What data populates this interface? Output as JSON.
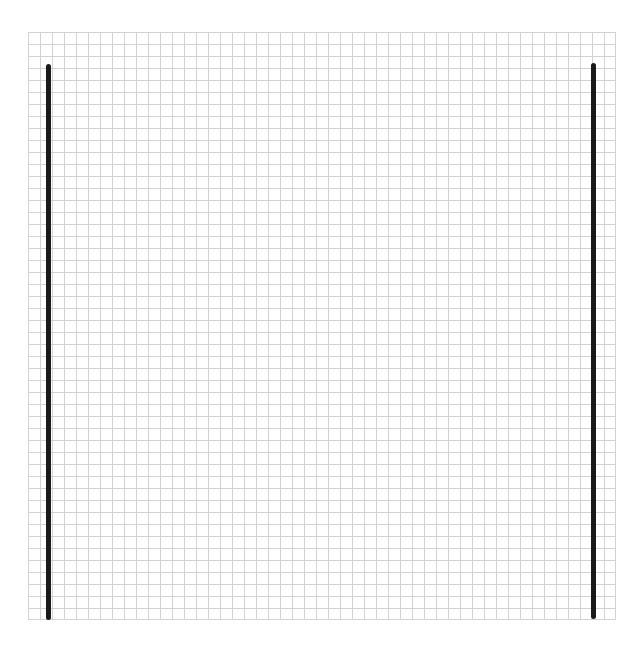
{
  "canvas": {
    "width": 643,
    "height": 653,
    "background": "#ffffff"
  },
  "grid": {
    "cell_size": 12,
    "line_color": "#d2d2d2",
    "left": 28,
    "top": 32,
    "size": 588
  },
  "strokes": [
    {
      "name": "left-vertical-line",
      "x": 48,
      "y_start": 64,
      "y_end": 620,
      "color": "#1a1a1a"
    },
    {
      "name": "right-vertical-line",
      "x": 593,
      "y_start": 63,
      "y_end": 619,
      "color": "#1a1a1a"
    }
  ]
}
